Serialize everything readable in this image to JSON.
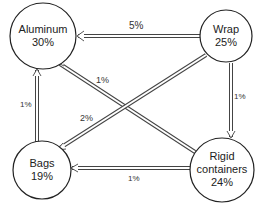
{
  "diagram": {
    "type": "flow-network",
    "nodes": [
      {
        "id": "aluminum",
        "name": "Aluminum",
        "value": "30%",
        "cx": 43,
        "cy": 36,
        "r": 33
      },
      {
        "id": "wrap",
        "name": "Wrap",
        "value": "25%",
        "cx": 226,
        "cy": 36,
        "r": 26
      },
      {
        "id": "bags",
        "name": "Bags",
        "value": "19%",
        "cx": 42,
        "cy": 170,
        "r": 29
      },
      {
        "id": "rigid",
        "name": "Rigid containers",
        "name_line1": "Rigid",
        "name_line2": "containers",
        "value": "24%",
        "cx": 222,
        "cy": 170,
        "r": 32
      }
    ],
    "edges": [
      {
        "from": "wrap",
        "to": "aluminum",
        "label": "5%"
      },
      {
        "from": "rigid",
        "to": "aluminum",
        "label": "1%"
      },
      {
        "from": "wrap",
        "to": "bags",
        "label": "2%"
      },
      {
        "from": "wrap",
        "to": "rigid",
        "label": "1%"
      },
      {
        "from": "bags",
        "to": "aluminum",
        "label": "1%"
      },
      {
        "from": "rigid",
        "to": "bags",
        "label": "1%"
      }
    ]
  }
}
